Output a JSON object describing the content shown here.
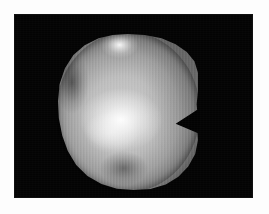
{
  "image": {
    "title": "Grayscale disc specimen image",
    "caption": "",
    "description": "Near-circular light-gray disc on a black background with a V-shaped notch cut into its right edge",
    "width_px": 269,
    "height_px": 214,
    "modality": "grayscale"
  },
  "frame": {
    "margin_color": "#fdfdfd",
    "canvas_background": "#030303",
    "canvas_left_px": 14,
    "canvas_top_px": 14,
    "canvas_width_px": 239,
    "canvas_height_px": 184
  },
  "subject": {
    "name": "disc",
    "shape": "ellipse-with-notch",
    "center_x_px": 114,
    "center_y_px": 98,
    "width_px": 140,
    "height_px": 156,
    "fill_color": "#bdbdbd",
    "rim_color": "#636363",
    "notch": {
      "name": "edge-notch",
      "position": "right",
      "shape": "v-wedge",
      "apex_x_px": 184,
      "apex_y_px": 106,
      "opening_px": 24
    }
  },
  "features": [
    {
      "name": "central-highlight",
      "label": "Central bright region",
      "center_pct_x": 45,
      "center_pct_y": 55,
      "intensity": "bright",
      "color": "#ffffff"
    },
    {
      "name": "top-bright-spot",
      "label": "Upper bright spot",
      "center_pct_x": 44,
      "center_pct_y": 7,
      "intensity": "bright",
      "color": "#ffffff"
    },
    {
      "name": "bottom-dark-smudge",
      "label": "Lower dark patch",
      "center_pct_x": 47,
      "center_pct_y": 86,
      "intensity": "dark",
      "color": "#282828"
    },
    {
      "name": "upper-left-dark-streak",
      "label": "Upper-left dark streak",
      "center_pct_x": 10,
      "center_pct_y": 31,
      "intensity": "dark",
      "color": "#191919"
    }
  ],
  "texture": {
    "name": "vertical-striping",
    "label": "Vertical scan striping",
    "orientation": "vertical",
    "period_px": 3
  },
  "colors": {
    "background": "#030303",
    "margin": "#fdfdfd",
    "highlight": "#ffffff",
    "midtone": "#bdbdbd",
    "shadow": "#636363"
  }
}
